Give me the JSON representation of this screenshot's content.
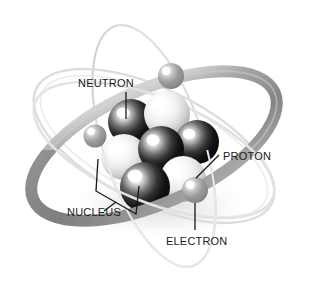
{
  "figure": {
    "background_color": "#ffffff",
    "width": 309,
    "height": 292,
    "style": "grayscale airbrush illustration"
  },
  "labels": {
    "neutron": "NEUTRON",
    "proton": "PROTON",
    "nucleus": "NUCLEUS",
    "electron": "ELECTRON"
  },
  "colors": {
    "label_text": "#1b1b1b",
    "leader_line": "#17181a",
    "orbit_thick_gray": "#8b8b8b",
    "orbit_faint_gray": "#d8d8d8",
    "electron_sphere": "#9a9a9a",
    "neutron_sphere_dark": "#1e1e1e",
    "proton_sphere_light": "#e9e9e9",
    "shadow": "#c9c9c9"
  },
  "parts": {
    "electrons": [
      {
        "name": "electron-top-right",
        "cx": 171,
        "cy": 76,
        "r": 13
      },
      {
        "name": "electron-left",
        "cx": 95,
        "cy": 136,
        "r": 11
      },
      {
        "name": "electron-bottom-right",
        "cx": 195,
        "cy": 190,
        "r": 13
      }
    ],
    "nucleons": [
      {
        "name": "neutron-upper-left",
        "type": "neutron",
        "cx": 131,
        "cy": 122,
        "r": 22
      },
      {
        "name": "proton-upper-right",
        "type": "proton",
        "cx": 166,
        "cy": 114,
        "r": 22
      },
      {
        "name": "proton-mid-left",
        "type": "proton",
        "cx": 124,
        "cy": 156,
        "r": 22
      },
      {
        "name": "neutron-center",
        "type": "neutron",
        "cx": 160,
        "cy": 148,
        "r": 22
      },
      {
        "name": "neutron-right",
        "type": "neutron",
        "cx": 196,
        "cy": 142,
        "r": 22
      },
      {
        "name": "neutron-bottom-left",
        "type": "neutron",
        "cx": 144,
        "cy": 186,
        "r": 24
      },
      {
        "name": "proton-bottom-right",
        "type": "proton",
        "cx": 182,
        "cy": 178,
        "r": 22
      }
    ],
    "orbits": [
      {
        "name": "orbit-thick",
        "rx": 132,
        "ry": 56,
        "rotate": -24,
        "thickness": 11,
        "tone": "thick"
      },
      {
        "name": "orbit-faint-a",
        "rx": 130,
        "ry": 54,
        "rotate": 26,
        "thickness": 2,
        "tone": "faint"
      },
      {
        "name": "orbit-faint-b",
        "rx": 126,
        "ry": 50,
        "rotate": 72,
        "thickness": 2,
        "tone": "faint"
      }
    ]
  },
  "callouts": [
    {
      "name": "callout-neutron",
      "label_key": "neutron",
      "text_x": 78,
      "text_y": 87,
      "anchor": "start"
    },
    {
      "name": "callout-proton",
      "label_key": "proton",
      "text_x": 222,
      "text_y": 162,
      "anchor": "start"
    },
    {
      "name": "callout-nucleus",
      "label_key": "nucleus",
      "text_x": 70,
      "text_y": 216,
      "anchor": "start"
    },
    {
      "name": "callout-electron",
      "label_key": "electron",
      "text_x": 167,
      "text_y": 245,
      "anchor": "start"
    }
  ]
}
